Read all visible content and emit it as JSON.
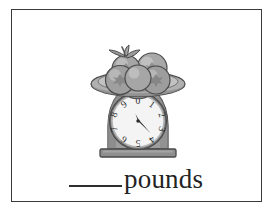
{
  "page": {
    "background_color": "#ffffff",
    "border_color": "#3a3a3a"
  },
  "illustration": {
    "name": "kitchen-scale-with-tomatoes",
    "description": "A kitchen scale holding a plate of tomatoes",
    "palette": {
      "outline": "#4a4a4a",
      "plate_fill": "#b9b9b9",
      "plate_shade": "#9d9d9d",
      "fruit_fill": "#a8a8a8",
      "fruit_highlight": "#c6c6c6",
      "fruit_shadow": "#8c8c8c",
      "leaf_fill": "#9a9a9a",
      "body_fill": "#9e9e9e",
      "body_shade": "#868686",
      "base_fill": "#8f8f8f",
      "dial_face": "#f2f2f2",
      "dial_rim": "#6d6d6d",
      "needle": "#2b2b2b",
      "digit": "#2b2b2b"
    },
    "dial": {
      "name": "scale-dial",
      "digits": [
        "0",
        "1",
        "2",
        "3",
        "4",
        "5",
        "6",
        "7",
        "8",
        "9"
      ],
      "digit_count": 10,
      "needle_points_between": [
        "3",
        "4"
      ]
    },
    "fruit": {
      "name": "tomatoes",
      "count": 4
    }
  },
  "answer": {
    "blank_label": "",
    "unit_label": "pounds"
  }
}
